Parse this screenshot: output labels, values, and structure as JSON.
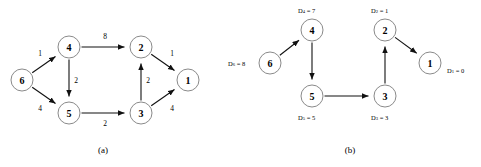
{
  "figure": {
    "panels": [
      {
        "id": "a",
        "caption": "(a)",
        "caption_x": 103,
        "caption_y": 150,
        "description": "directed weighted graph",
        "nodes": [
          {
            "id": "6",
            "label": "6",
            "cx": 22,
            "cy": 80,
            "r": 11
          },
          {
            "id": "4",
            "label": "4",
            "cx": 69,
            "cy": 47,
            "r": 11
          },
          {
            "id": "5",
            "label": "5",
            "cx": 69,
            "cy": 113,
            "r": 11
          },
          {
            "id": "2",
            "label": "2",
            "cx": 141,
            "cy": 47,
            "r": 11
          },
          {
            "id": "3",
            "label": "3",
            "cx": 141,
            "cy": 113,
            "r": 11
          },
          {
            "id": "1",
            "label": "1",
            "cx": 188,
            "cy": 80,
            "r": 11
          }
        ],
        "edges": [
          {
            "from": "6",
            "to": "4",
            "weight": "1",
            "wx": 40,
            "wy": 53
          },
          {
            "from": "6",
            "to": "5",
            "weight": "4",
            "wx": 40,
            "wy": 108
          },
          {
            "from": "4",
            "to": "2",
            "weight": "8",
            "wx": 105,
            "wy": 36
          },
          {
            "from": "4",
            "to": "5",
            "weight": "2",
            "wx": 76,
            "wy": 80
          },
          {
            "from": "5",
            "to": "3",
            "weight": "2",
            "wx": 105,
            "wy": 123
          },
          {
            "from": "3",
            "to": "2",
            "weight": "2",
            "wx": 148,
            "wy": 80
          },
          {
            "from": "2",
            "to": "1",
            "weight": "1",
            "wx": 172,
            "wy": 53
          },
          {
            "from": "3",
            "to": "1",
            "weight": "4",
            "wx": 172,
            "wy": 108
          }
        ]
      },
      {
        "id": "b",
        "caption": "(b)",
        "caption_x": 110,
        "caption_y": 150,
        "description": "shortest path tree with distance labels",
        "nodes": [
          {
            "id": "6",
            "label": "6",
            "cx": 30,
            "cy": 63,
            "r": 11
          },
          {
            "id": "4",
            "label": "4",
            "cx": 72,
            "cy": 30,
            "r": 11
          },
          {
            "id": "5",
            "label": "5",
            "cx": 72,
            "cy": 96,
            "r": 11
          },
          {
            "id": "2",
            "label": "2",
            "cx": 145,
            "cy": 30,
            "r": 11
          },
          {
            "id": "3",
            "label": "3",
            "cx": 145,
            "cy": 96,
            "r": 11
          },
          {
            "id": "1",
            "label": "1",
            "cx": 190,
            "cy": 63,
            "r": 11
          }
        ],
        "edges": [
          {
            "from": "6",
            "to": "4"
          },
          {
            "from": "4",
            "to": "5"
          },
          {
            "from": "5",
            "to": "3"
          },
          {
            "from": "3",
            "to": "2"
          },
          {
            "from": "2",
            "to": "1"
          }
        ],
        "distances": [
          {
            "node": "6",
            "prefix": "D",
            "sub": "6",
            "eq": " = 8",
            "x": -12,
            "y": 63,
            "anchor": "start"
          },
          {
            "node": "4",
            "prefix": "D",
            "sub": "4",
            "eq": " = 7",
            "x": 58,
            "y": 10,
            "anchor": "start"
          },
          {
            "node": "5",
            "prefix": "D",
            "sub": "5",
            "eq": " = 5",
            "x": 58,
            "y": 117,
            "anchor": "start"
          },
          {
            "node": "3",
            "prefix": "D",
            "sub": "3",
            "eq": " = 3",
            "x": 131,
            "y": 117,
            "anchor": "start"
          },
          {
            "node": "2",
            "prefix": "D",
            "sub": "2",
            "eq": " = 1",
            "x": 131,
            "y": 10,
            "anchor": "start"
          },
          {
            "node": "1",
            "prefix": "D",
            "sub": "1",
            "eq": " = 0",
            "x": 207,
            "y": 70,
            "anchor": "start"
          }
        ]
      }
    ]
  },
  "colors": {
    "node_stroke": "#8a8a8a",
    "node_fill": "#ffffff",
    "edge": "#111111",
    "text": "#000000",
    "background": "#ffffff"
  }
}
